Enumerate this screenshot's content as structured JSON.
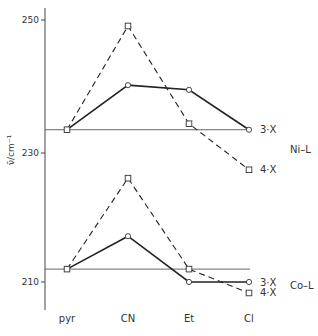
{
  "chart_data": {
    "type": "line",
    "title": "",
    "xlabel": "",
    "ylabel": "ν̄/cm⁻¹",
    "categories": [
      "pyr",
      "CN",
      "Et",
      "Cl"
    ],
    "yticks": [
      210,
      230,
      250
    ],
    "ylim": [
      206,
      252
    ],
    "grid": false,
    "groups": [
      {
        "name": "Ni–L",
        "baseline": 233.5,
        "series": [
          {
            "name": "3·X",
            "style": "solid",
            "marker": "circle",
            "values": [
              233.5,
              240.2,
              239.5,
              233.5
            ]
          },
          {
            "name": "4·X",
            "style": "dashed",
            "marker": "square",
            "values": [
              233.5,
              249.1,
              234.4,
              227.4
            ]
          }
        ]
      },
      {
        "name": "Co–L",
        "baseline": 212.0,
        "series": [
          {
            "name": "3·X",
            "style": "solid",
            "marker": "circle",
            "values": [
              212.0,
              217.1,
              210.0,
              210.0
            ]
          },
          {
            "name": "4·X",
            "style": "dashed",
            "marker": "square",
            "values": [
              212.0,
              226.1,
              212.0,
              208.3
            ]
          }
        ]
      }
    ]
  }
}
